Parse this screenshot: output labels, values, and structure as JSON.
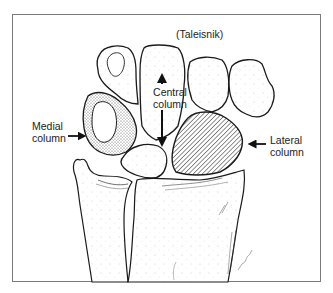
{
  "figure": {
    "caption": "(Taleisnik)",
    "labels": {
      "central": [
        "Central",
        "column"
      ],
      "medial": [
        "Medial",
        "column"
      ],
      "lateral": [
        "Lateral",
        "column"
      ]
    },
    "arrows": {
      "central": "up-down",
      "medial": "right",
      "lateral": "left"
    },
    "colors": {
      "frame": "#7a7a7a",
      "ink": "#1a1a1a",
      "background": "#ffffff"
    }
  }
}
